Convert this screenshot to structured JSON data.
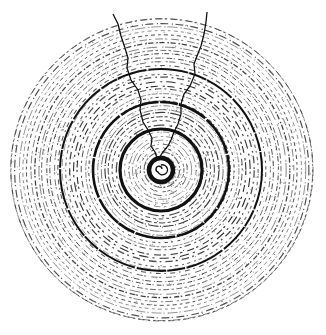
{
  "image": {
    "subject": "Cross-section of a tree trunk showing annual growth rings with two radial cracks",
    "style": "black ink stipple engraving on white",
    "ink_color": "#111111",
    "paper_color": "#ffffff",
    "ring_count_approx": 36,
    "dark_ring_count": 4,
    "crack_count": 2
  }
}
